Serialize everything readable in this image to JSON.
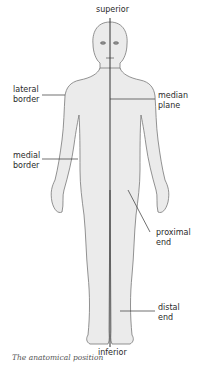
{
  "figure": {
    "caption": "The anatomical position",
    "body_color": "#ebebeb",
    "outline_color": "#777777",
    "line_color": "#333333"
  },
  "labels": {
    "superior": "superior",
    "inferior": "inferior",
    "lateral_border": [
      "lateral",
      "border"
    ],
    "median_plane": [
      "median",
      "plane"
    ],
    "medial_border": [
      "medial",
      "border"
    ],
    "proximal_end": [
      "proximal",
      "end"
    ],
    "distal_end": [
      "distal",
      "end"
    ]
  }
}
